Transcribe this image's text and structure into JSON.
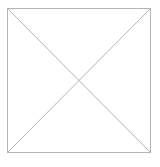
{
  "placeholder": {
    "icon": "image-placeholder-icon",
    "stroke_color": "#b4b4b4",
    "box": {
      "x1": 7,
      "y1": 8,
      "x2": 151,
      "y2": 153
    }
  }
}
